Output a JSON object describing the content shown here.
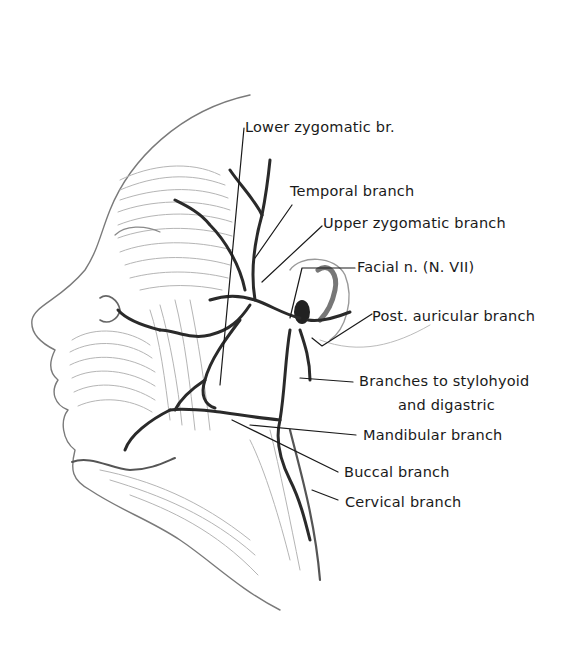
{
  "figure": {
    "colors": {
      "background": "#ffffff",
      "nerve": "#2a2a2a",
      "sketch": "#9a9a9a",
      "text": "#1a1a1a"
    }
  },
  "labels": [
    {
      "id": "lower-zygomatic",
      "text": "Lower zygomatic br."
    },
    {
      "id": "temporal",
      "text": "Temporal branch"
    },
    {
      "id": "upper-zygomatic",
      "text": "Upper zygomatic branch"
    },
    {
      "id": "facial-nerve",
      "text": "Facial n. (N. VII)"
    },
    {
      "id": "post-auricular",
      "text": "Post. auricular branch"
    },
    {
      "id": "stylohyoid-digastric",
      "text": "Branches to stylohyoid",
      "text2": "and digastric"
    },
    {
      "id": "mandibular",
      "text": "Mandibular branch"
    },
    {
      "id": "buccal",
      "text": "Buccal branch"
    },
    {
      "id": "cervical",
      "text": "Cervical branch"
    }
  ]
}
